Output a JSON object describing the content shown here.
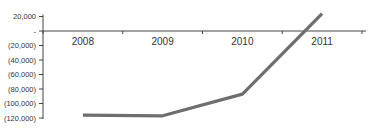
{
  "chart_data": {
    "type": "line",
    "title": "",
    "xlabel": "",
    "ylabel": "",
    "categories": [
      "2008",
      "2009",
      "2010",
      "2011"
    ],
    "series": [
      {
        "name": "Series 1",
        "values": [
          -116000,
          -117000,
          -87000,
          24000
        ],
        "color": "#6e6e6e"
      }
    ],
    "y_ticks": [
      {
        "value": 20000,
        "label": "20,000"
      },
      {
        "value": 0,
        "label": "-"
      },
      {
        "value": -20000,
        "label": "(20,000)"
      },
      {
        "value": -40000,
        "label": "(40,000)"
      },
      {
        "value": -60000,
        "label": "(60,000)"
      },
      {
        "value": -80000,
        "label": "(80,000)"
      },
      {
        "value": -100000,
        "label": "(100,000)"
      },
      {
        "value": -120000,
        "label": "(120,000)"
      }
    ],
    "ylim": [
      -120000,
      20000
    ],
    "grid": false,
    "legend": "none",
    "x_axis_at": 0
  }
}
